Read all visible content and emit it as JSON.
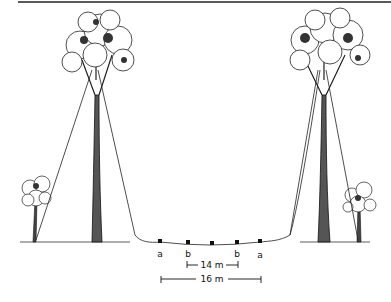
{
  "figure": {
    "markers": [
      {
        "label": "a",
        "x": 160
      },
      {
        "label": "b",
        "x": 188
      },
      {
        "label": "",
        "x": 212
      },
      {
        "label": "b",
        "x": 237
      },
      {
        "label": "a",
        "x": 260
      }
    ],
    "dimension_inner": "14 m",
    "dimension_outer": "16 m"
  }
}
